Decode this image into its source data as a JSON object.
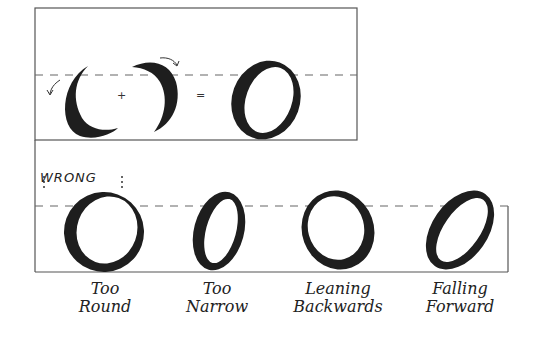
{
  "figure": {
    "top_panel": {
      "operators": {
        "plus": "+",
        "equals": "="
      },
      "strokes": [
        "left-stroke",
        "right-stroke",
        "result-o"
      ]
    },
    "wrong_label": "WRONG",
    "examples": [
      {
        "line1": "Too",
        "line2": "Round"
      },
      {
        "line1": "Too",
        "line2": "Narrow"
      },
      {
        "line1": "Leaning",
        "line2": "Backwards"
      },
      {
        "line1": "Falling",
        "line2": "Forward"
      }
    ],
    "colors": {
      "ink": "#1e1e1e",
      "line": "#555555"
    }
  }
}
